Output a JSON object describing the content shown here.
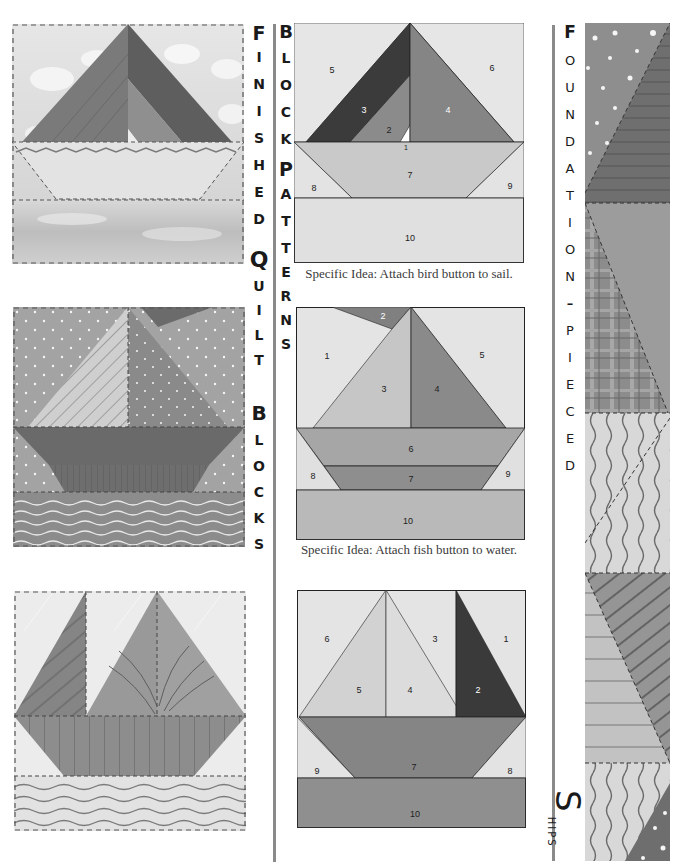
{
  "left_column": {
    "quilts": [
      {
        "name": "finished-sailboat-quilt-1",
        "description": "Sailboat block with cloud sky and watercolor water"
      },
      {
        "name": "finished-sailboat-quilt-2",
        "description": "Sailboat block with dotted sky, striped sails and wavy water"
      },
      {
        "name": "finished-sailboat-quilt-3",
        "description": "Two-sail boat block with striped hull and wavy water"
      }
    ]
  },
  "vertical_title_1": {
    "letters": [
      "F",
      "I",
      "N",
      "I",
      "S",
      "H",
      "E",
      "D",
      "",
      "Q",
      "U",
      "I",
      "L",
      "T",
      "",
      "B",
      "L",
      "O",
      "C",
      "K",
      "S"
    ]
  },
  "vertical_title_2": {
    "letters": [
      "B",
      "L",
      "O",
      "C",
      "K",
      "",
      "P",
      "A",
      "T",
      "T",
      "E",
      "R",
      "N",
      "S"
    ]
  },
  "vertical_title_3": {
    "letters": [
      "F",
      "O",
      "U",
      "N",
      "D",
      "A",
      "T",
      "I",
      "O",
      "N",
      "–",
      "P",
      "I",
      "E",
      "C",
      "E",
      "D"
    ]
  },
  "side_label": {
    "big_letter": "S",
    "rest": "HIPS"
  },
  "patterns": [
    {
      "caption": "Specific Idea: Attach bird button to sail.",
      "pieces": [
        "1",
        "2",
        "3",
        "4",
        "5",
        "6",
        "7",
        "8",
        "9",
        "10"
      ]
    },
    {
      "caption": "Specific Idea: Attach fish button to water.",
      "pieces": [
        "1",
        "2",
        "3",
        "4",
        "5",
        "6",
        "7",
        "8",
        "9",
        "10"
      ]
    },
    {
      "caption": "",
      "pieces": [
        "1",
        "2",
        "3",
        "4",
        "5",
        "6",
        "7",
        "8",
        "9",
        "10"
      ]
    }
  ],
  "colors": {
    "background": "#d9d9d9",
    "light": "#e4e4e4",
    "mid": "#a8a8a8",
    "dark": "#7c7c7c",
    "darkest": "#3a3a3a",
    "divider": "#8a8a8a"
  }
}
